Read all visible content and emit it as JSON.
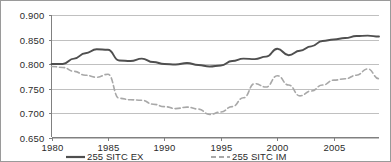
{
  "chart_data": {
    "type": "line",
    "title": "",
    "subtitle": "",
    "xlabel": "",
    "ylabel": "",
    "xlim": [
      1980,
      2009
    ],
    "ylim": [
      0.65,
      0.9
    ],
    "grid": true,
    "legend_position": "bottom",
    "y_ticks": [
      "0.650",
      "0.700",
      "0.750",
      "0.800",
      "0.850",
      "0.900"
    ],
    "y_tick_values": [
      0.65,
      0.7,
      0.75,
      0.8,
      0.85,
      0.9
    ],
    "x_ticks": [
      "1980",
      "1985",
      "1990",
      "1995",
      "2000",
      "2005"
    ],
    "x_tick_values": [
      1980,
      1985,
      1990,
      1995,
      2000,
      2005
    ],
    "x": [
      1980,
      1981,
      1982,
      1983,
      1984,
      1985,
      1986,
      1987,
      1988,
      1989,
      1990,
      1991,
      1992,
      1993,
      1994,
      1995,
      1996,
      1997,
      1998,
      1999,
      2000,
      2001,
      2002,
      2003,
      2004,
      2005,
      2006,
      2007,
      2008,
      2009
    ],
    "series": [
      {
        "name": "255 SITC EX",
        "color": "#4f4f4f",
        "style": "solid",
        "values": [
          0.8,
          0.8,
          0.811,
          0.822,
          0.83,
          0.829,
          0.807,
          0.806,
          0.811,
          0.804,
          0.8,
          0.799,
          0.802,
          0.798,
          0.795,
          0.797,
          0.806,
          0.811,
          0.81,
          0.815,
          0.831,
          0.818,
          0.827,
          0.836,
          0.847,
          0.85,
          0.853,
          0.857,
          0.858,
          0.856
        ]
      },
      {
        "name": "255 SITC IM",
        "color": "#a8a8a8",
        "style": "dashed",
        "values": [
          0.795,
          0.793,
          0.785,
          0.777,
          0.773,
          0.779,
          0.73,
          0.727,
          0.726,
          0.718,
          0.713,
          0.709,
          0.712,
          0.708,
          0.697,
          0.702,
          0.713,
          0.731,
          0.76,
          0.753,
          0.776,
          0.757,
          0.735,
          0.745,
          0.757,
          0.767,
          0.77,
          0.777,
          0.79,
          0.77
        ]
      }
    ]
  },
  "legend": {
    "items": [
      {
        "label": "255 SITC EX",
        "style": "solid",
        "color": "#4f4f4f"
      },
      {
        "label": "255 SITC IM",
        "style": "dashed",
        "color": "#a8a8a8"
      }
    ]
  },
  "colors": {
    "gridline": "#b0b0b0",
    "axis": "#808080",
    "frame": "#9a9a9a",
    "text": "#2b2b2b",
    "background": "#ffffff"
  }
}
